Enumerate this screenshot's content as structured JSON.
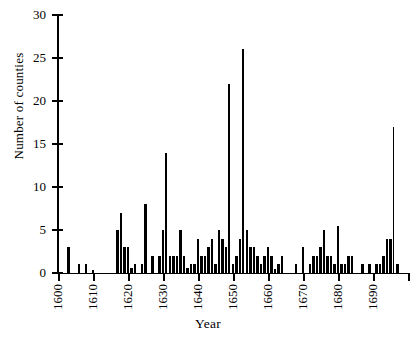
{
  "chart_data": {
    "type": "bar",
    "title": "",
    "xlabel": "Year",
    "ylabel": "Number of counties",
    "xlim": [
      1599,
      1700
    ],
    "ylim": [
      0,
      30
    ],
    "ytick_values": [
      0,
      5,
      10,
      15,
      20,
      25,
      30
    ],
    "xtick_values": [
      1600,
      1610,
      1620,
      1630,
      1640,
      1650,
      1660,
      1670,
      1680,
      1690
    ],
    "grid": false,
    "legend": null,
    "x": [
      1600,
      1601,
      1602,
      1603,
      1604,
      1605,
      1606,
      1607,
      1608,
      1609,
      1610,
      1611,
      1612,
      1613,
      1614,
      1615,
      1616,
      1617,
      1618,
      1619,
      1620,
      1621,
      1622,
      1623,
      1624,
      1625,
      1626,
      1627,
      1628,
      1629,
      1630,
      1631,
      1632,
      1633,
      1634,
      1635,
      1636,
      1637,
      1638,
      1639,
      1640,
      1641,
      1642,
      1643,
      1644,
      1645,
      1646,
      1647,
      1648,
      1649,
      1650,
      1651,
      1652,
      1653,
      1654,
      1655,
      1656,
      1657,
      1658,
      1659,
      1660,
      1661,
      1662,
      1663,
      1664,
      1665,
      1666,
      1667,
      1668,
      1669,
      1670,
      1671,
      1672,
      1673,
      1674,
      1675,
      1676,
      1677,
      1678,
      1679,
      1680,
      1681,
      1682,
      1683,
      1684,
      1685,
      1686,
      1687,
      1688,
      1689,
      1690,
      1691,
      1692,
      1693,
      1694,
      1695,
      1696,
      1697,
      1698,
      1699
    ],
    "values": [
      0,
      0,
      0,
      3,
      0,
      0,
      1,
      0,
      1,
      0,
      0.4,
      0,
      0,
      0,
      0,
      0,
      0,
      5,
      7,
      3,
      3,
      0.6,
      1,
      0,
      1,
      8,
      0,
      2,
      0,
      2,
      5,
      14,
      2,
      2,
      2,
      5,
      2,
      0.6,
      1,
      1,
      4,
      2,
      2,
      3,
      4,
      1,
      5,
      4,
      3,
      22,
      1,
      2,
      4,
      26,
      5,
      3,
      3,
      2,
      1,
      2,
      3,
      2,
      0.5,
      1,
      2,
      0,
      0,
      0,
      1,
      0,
      3,
      0,
      1,
      2,
      2,
      3,
      5,
      2,
      2,
      1,
      5.5,
      1,
      1,
      2,
      2,
      0,
      0,
      1,
      0,
      1,
      0,
      1,
      1,
      2,
      4,
      4,
      17,
      1,
      0,
      0
    ],
    "series_name": "Number of counties"
  }
}
